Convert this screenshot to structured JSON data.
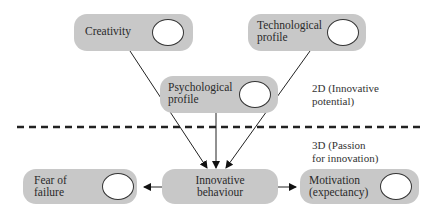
{
  "nodes": {
    "creativity": {
      "label": "Creativity"
    },
    "technological": {
      "label_line1": "Technological",
      "label_line2": "profile"
    },
    "psychological": {
      "label_line1": "Psychological",
      "label_line2": "profile"
    },
    "innovative": {
      "label_line1": "Innovative",
      "label_line2": "behaviour"
    },
    "fear": {
      "label_line1": "Fear of",
      "label_line2": "failure"
    },
    "motivation": {
      "label_line1": "Motivation",
      "label_line2": "(expectancy)"
    }
  },
  "annotations": {
    "two_d": {
      "line1": "2D (Innovative",
      "line2": "potential)"
    },
    "three_d": {
      "line1": "3D (Passion",
      "line2": "for innovation)"
    }
  },
  "colors": {
    "node_fill": "#c8c8c8",
    "oval_fill": "#ffffff",
    "line": "#222222"
  }
}
